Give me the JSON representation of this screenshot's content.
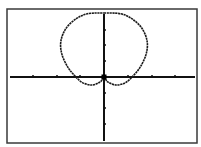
{
  "colors": {
    "background": "#ffffff",
    "frame": "#3a3a3a",
    "axis": "#111111",
    "curve": "#1a1a1a"
  },
  "screen": {
    "frame": {
      "x1": 7,
      "y1": 9,
      "x2": 197,
      "y2": 143
    },
    "origin": {
      "x": 104,
      "y": 77
    },
    "x_tick_px": [
      33,
      57,
      80,
      128,
      152,
      175
    ],
    "y_tick_px": [
      30,
      45,
      61,
      93,
      108,
      124
    ]
  },
  "chart_data": {
    "type": "line",
    "title": "",
    "xlabel": "",
    "ylabel": "",
    "grid": false,
    "legend": "none",
    "xlim": [
      -4.4,
      3.9
    ],
    "ylim": [
      -4.2,
      4.3
    ],
    "x_ticks": [
      -3,
      -2,
      -1,
      1,
      2,
      3
    ],
    "y_ticks": [
      -3,
      -2,
      -1,
      1,
      2,
      3
    ],
    "series": [
      {
        "name": "curve",
        "points": [
          [
            0,
            4.0
          ],
          [
            0.7,
            3.95
          ],
          [
            1.2,
            3.6
          ],
          [
            1.6,
            3.0
          ],
          [
            1.8,
            2.2
          ],
          [
            1.75,
            1.4
          ],
          [
            1.5,
            0.6
          ],
          [
            1.2,
            0.05
          ],
          [
            0.9,
            -0.35
          ],
          [
            0.5,
            -0.5
          ],
          [
            0.15,
            -0.3
          ],
          [
            0,
            0
          ],
          [
            -0.15,
            -0.3
          ],
          [
            -0.5,
            -0.5
          ],
          [
            -0.9,
            -0.35
          ],
          [
            -1.2,
            0.05
          ],
          [
            -1.5,
            0.6
          ],
          [
            -1.75,
            1.4
          ],
          [
            -1.8,
            2.2
          ],
          [
            -1.6,
            3.0
          ],
          [
            -1.2,
            3.6
          ],
          [
            -0.7,
            3.95
          ],
          [
            0,
            4.0
          ]
        ]
      }
    ]
  }
}
